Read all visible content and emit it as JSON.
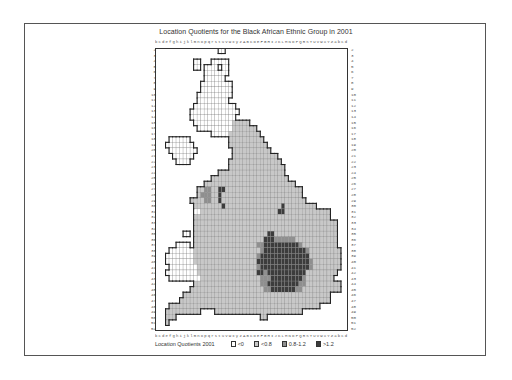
{
  "title": "Location Quotients for the Black African Ethnic Group in 2001",
  "columns": "bcdefghijklmnopqrstuvwxyzABCDEFGHIJKLMNOPQRSTUVWXYZabcd",
  "rows": [
    "2",
    "3",
    "4",
    "5",
    "6",
    "7",
    "8",
    "9",
    "10",
    "11",
    "12",
    "13",
    "14",
    "15",
    "16",
    "17",
    "18",
    "19",
    "20",
    "21",
    "22",
    "23",
    "24",
    "25",
    "26",
    "27",
    "28",
    "29",
    "30",
    "31",
    "32",
    "33",
    "34",
    "35",
    "36",
    "37",
    "38",
    "39",
    "40",
    "41",
    "42",
    "43",
    "44",
    "45",
    "46",
    "47",
    "48",
    "49",
    "50",
    "51",
    "52"
  ],
  "legend": {
    "title": "Location Quotients 2001",
    "items": [
      {
        "label": "<0",
        "color": "#ffffff"
      },
      {
        "label": "<0.8",
        "color": "#c8c8c8"
      },
      {
        "label": "0.8-1.2",
        "color": "#8f8f8f"
      },
      {
        "label": ">1.2",
        "color": "#3c3c3c"
      }
    ]
  },
  "chart_data": {
    "type": "heatmap",
    "title": "Location Quotients for the Black African Ethnic Group in 2001",
    "xlabel": "columns b..d",
    "ylabel": "rows 2..52",
    "legend_title": "Location Quotients 2001",
    "classes": {
      "w": "<0",
      "l": "<0.8",
      "m": "0.8-1.2",
      "d": ">1.2",
      ".": "no data"
    },
    "grid": [
      "..................ww....................................",
      "........................................................",
      "...........ww...wwwww...................................",
      "...........ww.wwww.ww...................................",
      "..............wwwwwww...................................",
      "..............wwwwww....................................",
      ".............wwwwwwwww..................................",
      ".............wwwwwwwww..................................",
      "............wwwwwwwwww..................................",
      "............wwwwwwwww...................................",
      "...........wwwwwwwwwwww.................................",
      "..........wwwwwwwwwwwwww................................",
      "..........wwwwwwwwwwwww.................................",
      "...........wwwwwwwwwwwlllll.............................",
      "............wwwwwwwwwwlllllll...........................",
      "................wwwwwlllllllll..........................",
      "....wwwwww...........llllllllll.........................",
      "...wwwwwwww..........lllllllllll........................",
      "....wwwwwwww..........lllllllllll.......................",
      ".....wwwwww...........lllllllllllll.....................",
      "......wwww...........lllllllllllllll....................",
      ".....................llllllllllllllll...................",
      "..................lllllllllllllllllll...................",
      "................llllllllllllllllllllll..................",
      "..............llllllllllllllllllllllllll................",
      "............llmmllddllllllllllllllllllllll..............",
      "............lmmmlldlllllllllllllllllllllll..............",
      "..........llllmmlldllllllllllllllllllllllll.............",
      "...........lllllllldlllllllllllllllldlllllllll..........",
      "...........wwllllllllllllllllllllllddlllllllllllll......",
      "...........lllllllllllllllllllllllllllllllllllllll......",
      "...........lllllllllllllllllllllllllllllllllllllllll....",
      "...........lllllllllllllllllllllllllllllllllllllllll....",
      "........ww.lllllllllllllllllllllddllllllllllllllllll....",
      "...........lllllllllllllllllllldddmmmmmmllllllllllll....",
      "......wwww.llllllllllllllllllmmddddddddddmllllllllll....",
      "....wwwwwwwlllllllllllllllllllmddddddddddddmlllllllll...",
      "...wwwwwwwwllllllllllllllllllmddddddddddddddlllllllll...",
      "...wwwwwwwwlllllllllllllllllldddddddddddddddmllllllll...",
      "....wwwwwwwwlllllllllllllllllmddddddddddddddmllllllll...",
      "...wwwwwwwwwlllllllllllllllllddmdddddddddddlllllllll....",
      "....wwwwwwwwwlllllllllllllllllmmmdddddddddmllllllll.....",
      "...........lllllllllllllllllllmmdddddddddmmllllllllll...",
      "..........lllllllllllllllllllllmmdddddddmmlllllllllll...",
      "........llllllllllllllllllllllllllllllllllllllllll......",
      ".......lllllllllllllllllllllllllllllllllllllllllll......",
      "....lllllllllllllllllllllllllllllllllllllllllll.........",
      "...llllllllll....lllllllllllllllllllllllll..............",
      "...lll........................ll........................",
      "...l....................................................",
      "........................................................"
    ]
  }
}
